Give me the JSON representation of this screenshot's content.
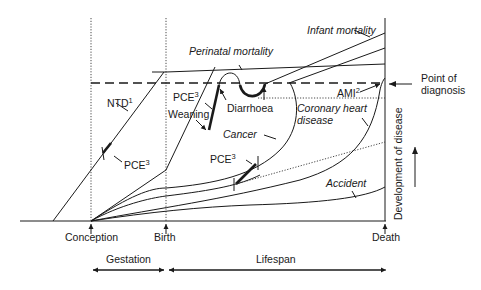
{
  "diagram": {
    "axes": {
      "x_markers": [
        "Conception",
        "Birth",
        "Death"
      ],
      "y_label": "Development of disease",
      "threshold_label_line1": "Point of",
      "threshold_label_line2": "diagnosis",
      "periods": {
        "gestation": "Gestation",
        "lifespan": "Lifespan"
      }
    },
    "curves": {
      "infant_mortality": "Infant mortality",
      "perinatal_mortality": "Perinatal mortality",
      "ntd": {
        "label": "NTD",
        "sup": "1"
      },
      "ami": {
        "label": "AMI",
        "sup": "2"
      },
      "pce_a": {
        "label": "PCE",
        "sup": "3"
      },
      "pce_b": {
        "label": "PCE",
        "sup": "3"
      },
      "pce_c": {
        "label": "PCE",
        "sup": "3"
      },
      "weaning": "Weaning",
      "diarrhoea": "Diarrhoea",
      "cancer": "Cancer",
      "chd_line1": "Coronary heart",
      "chd_line2": "disease",
      "accident": "Accident"
    },
    "colors": {
      "ink": "#1a1a1a",
      "background": "#ffffff"
    }
  }
}
